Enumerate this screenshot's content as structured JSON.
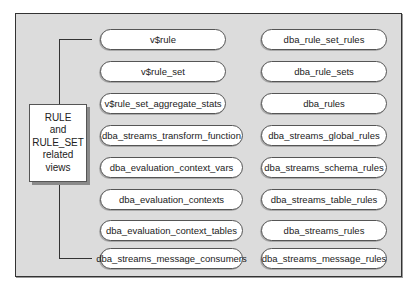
{
  "diagram": {
    "center_label_lines": [
      "RULE",
      "and",
      "RULE_SET",
      "related",
      "views"
    ],
    "left_column": [
      "v$rule",
      "v$rule_set",
      "v$rule_set_aggregate_stats",
      "dba_streams_transform_function",
      "dba_evaluation_context_vars",
      "dba_evaluation_contexts",
      "dba_evaluation_context_tables",
      "dba_streams_message_consumers"
    ],
    "right_column": [
      "dba_rule_set_rules",
      "dba_rule_sets",
      "dba_rules",
      "dba_streams_global_rules",
      "dba_streams_schema_rules",
      "dba_streams_table_rules",
      "dba_streams_rules",
      "dba_streams_message_rules"
    ],
    "colors": {
      "background": "#dcdcdc",
      "box_fill": "#ffffff",
      "line": "#333333"
    }
  }
}
